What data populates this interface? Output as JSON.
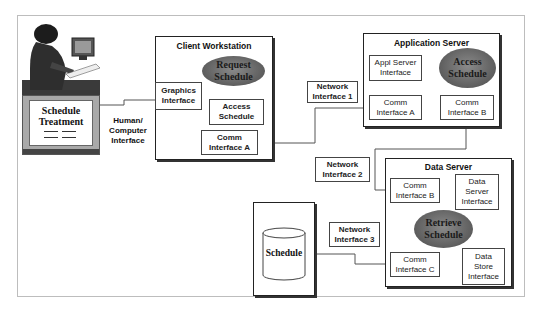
{
  "diagram": {
    "user_station": {
      "screen_title_line1": "Schedule",
      "screen_title_line2": "Treatment",
      "link_label_line1": "Human/",
      "link_label_line2": "Computer",
      "link_label_line3": "Interface"
    },
    "client_workstation": {
      "title": "Client Workstation",
      "graphics_interface_line1": "Graphics",
      "graphics_interface_line2": "Interface",
      "request_schedule_line1": "Request",
      "request_schedule_line2": "Schedule",
      "access_schedule_line1": "Access",
      "access_schedule_line2": "Schedule",
      "comm_interface_line1": "Comm",
      "comm_interface_line2": "Interface A"
    },
    "network_interface_1": {
      "line1": "Network",
      "line2": "Interface 1"
    },
    "application_server": {
      "title": "Application Server",
      "appl_server_interface_line1": "Appl Server",
      "appl_server_interface_line2": "Interface",
      "access_schedule_line1": "Access",
      "access_schedule_line2": "Schedule",
      "comm_a_line1": "Comm",
      "comm_a_line2": "Interface A",
      "comm_b_line1": "Comm",
      "comm_b_line2": "Interface B"
    },
    "network_interface_2": {
      "line1": "Network",
      "line2": "Interface 2"
    },
    "data_server": {
      "title": "Data Server",
      "comm_b_line1": "Comm",
      "comm_b_line2": "Interface B",
      "data_server_interface_line1": "Data",
      "data_server_interface_line2": "Server",
      "data_server_interface_line3": "Interface",
      "retrieve_schedule_line1": "Retrieve",
      "retrieve_schedule_line2": "Schedule",
      "comm_c_line1": "Comm",
      "comm_c_line2": "Interface C",
      "data_store_interface_line1": "Data",
      "data_store_interface_line2": "Store",
      "data_store_interface_line3": "Interface"
    },
    "network_interface_3": {
      "line1": "Network",
      "line2": "Interface 3"
    },
    "database": {
      "label": "Schedule"
    },
    "colors": {
      "process_ellipse": "#5d5d5d",
      "border": "#444444",
      "frame": "#bdbdbd"
    }
  }
}
